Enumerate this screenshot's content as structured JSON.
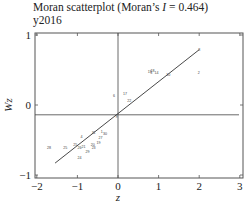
{
  "header": {
    "title_prefix": "Moran scatterplot (Moran’s ",
    "title_stat": "I",
    "title_suffix": " = 0.464)",
    "subtitle": "y2016"
  },
  "chart_data": {
    "type": "scatter",
    "title": "Moran scatterplot (Moran’s I = 0.464)",
    "subtitle": "y2016",
    "xlabel": "z",
    "ylabel": "Wz",
    "xlim": [
      -2.1,
      3.1
    ],
    "ylim": [
      -1.05,
      1.05
    ],
    "xticks": [
      -2,
      -1,
      0,
      1,
      2,
      3
    ],
    "yticks": [
      -1,
      0,
      1
    ],
    "grid": false,
    "moran_I": 0.464,
    "reference_lines": {
      "vertical_z": 0,
      "horizontal_wz": -0.14
    },
    "regression_line": {
      "x": [
        -1.55,
        2.0
      ],
      "y": [
        -0.83,
        0.79
      ]
    },
    "points": [
      {
        "label": "8",
        "z": 2.0,
        "wz": 0.79
      },
      {
        "label": "2",
        "z": 1.99,
        "wz": 0.47
      },
      {
        "label": "10",
        "z": 1.24,
        "wz": 0.44
      },
      {
        "label": "14",
        "z": 0.95,
        "wz": 0.46
      },
      {
        "label": "18",
        "z": 0.85,
        "wz": 0.49
      },
      {
        "label": "5",
        "z": 0.82,
        "wz": 0.47
      },
      {
        "label": "15",
        "z": 0.78,
        "wz": 0.48
      },
      {
        "label": "17",
        "z": 0.17,
        "wz": 0.16
      },
      {
        "label": "22",
        "z": 0.28,
        "wz": 0.07
      },
      {
        "label": "6",
        "z": -0.1,
        "wz": 0.13
      },
      {
        "label": "9",
        "z": -0.04,
        "wz": -0.17
      },
      {
        "label": "1",
        "z": -0.4,
        "wz": -0.38
      },
      {
        "label": "31",
        "z": -0.6,
        "wz": -0.39
      },
      {
        "label": "30",
        "z": -0.32,
        "wz": -0.41
      },
      {
        "label": "27",
        "z": -0.43,
        "wz": -0.47
      },
      {
        "label": "19",
        "z": -0.48,
        "wz": -0.54
      },
      {
        "label": "4",
        "z": -0.9,
        "wz": -0.45
      },
      {
        "label": "20",
        "z": -0.62,
        "wz": -0.57
      },
      {
        "label": "23",
        "z": -0.6,
        "wz": -0.6
      },
      {
        "label": "21",
        "z": -0.85,
        "wz": -0.59
      },
      {
        "label": "26",
        "z": -0.95,
        "wz": -0.61
      },
      {
        "label": "25",
        "z": -1.05,
        "wz": -0.56
      },
      {
        "label": "25",
        "z": -1.3,
        "wz": -0.6
      },
      {
        "label": "28",
        "z": -1.7,
        "wz": -0.61
      },
      {
        "label": "24",
        "z": -0.95,
        "wz": -0.75
      },
      {
        "label": "29",
        "z": -0.75,
        "wz": -0.66
      }
    ]
  }
}
